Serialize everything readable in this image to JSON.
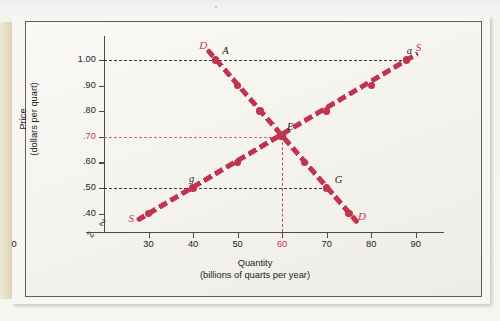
{
  "figure": {
    "background_color": "#f4f3ee",
    "frame_color": "#5d6066"
  },
  "chart_data": {
    "type": "line",
    "title": "",
    "xlabel": "Quantity",
    "xlabel_sub": "(billions of quarts per year)",
    "ylabel": "Price",
    "ylabel_sub": "(dollars per quart)",
    "xlim": [
      20,
      95
    ],
    "ylim": [
      0.33,
      1.07
    ],
    "grid": false,
    "legend": "none",
    "axis_break_x": true,
    "axis_break_y": true,
    "origin_label": "0",
    "xticks": [
      "30",
      "40",
      "50",
      "60",
      "70",
      "80",
      "90"
    ],
    "xtick_values": [
      30,
      40,
      50,
      60,
      70,
      80,
      90
    ],
    "xtick_highlight": "60",
    "yticks": [
      "1.00",
      ".90",
      ".80",
      ".70",
      ".60",
      ".50",
      ".40"
    ],
    "ytick_values": [
      1.0,
      0.9,
      0.8,
      0.7,
      0.6,
      0.5,
      0.4
    ],
    "ytick_highlight": ".70",
    "series": [
      {
        "name": "D",
        "label": "Demand",
        "color": "#c1334f",
        "style": "dashed-thick",
        "start_label": "D",
        "end_label": "D",
        "points": [
          {
            "x": 45,
            "y": 1.0
          },
          {
            "x": 50,
            "y": 0.9
          },
          {
            "x": 55,
            "y": 0.8
          },
          {
            "x": 60,
            "y": 0.7
          },
          {
            "x": 65,
            "y": 0.6
          },
          {
            "x": 70,
            "y": 0.5
          },
          {
            "x": 75,
            "y": 0.4
          }
        ]
      },
      {
        "name": "S",
        "label": "Supply",
        "color": "#c1334f",
        "style": "dashed-thick",
        "start_label": "S",
        "end_label": "S",
        "points": [
          {
            "x": 30,
            "y": 0.4
          },
          {
            "x": 40,
            "y": 0.5
          },
          {
            "x": 50,
            "y": 0.6
          },
          {
            "x": 60,
            "y": 0.7
          },
          {
            "x": 70,
            "y": 0.8
          },
          {
            "x": 80,
            "y": 0.9
          },
          {
            "x": 88,
            "y": 1.0
          }
        ]
      }
    ],
    "annotations": [
      {
        "text": "A",
        "x": 45,
        "y": 1.0,
        "note": "demand at price 1.00"
      },
      {
        "text": "a",
        "x": 88,
        "y": 1.0,
        "note": "supply at price 1.00"
      },
      {
        "text": "E",
        "x": 60,
        "y": 0.7,
        "note": "equilibrium"
      },
      {
        "text": "g",
        "x": 40,
        "y": 0.5,
        "note": "supply at price .50"
      },
      {
        "text": "G",
        "x": 70,
        "y": 0.5,
        "note": "demand at price .50"
      }
    ],
    "guide_lines": [
      {
        "orientation": "horizontal",
        "value": 1.0,
        "color": "#3c3c40",
        "style": "dashed"
      },
      {
        "orientation": "horizontal",
        "value": 0.5,
        "color": "#3c3c40",
        "style": "dashed"
      },
      {
        "orientation": "horizontal",
        "value": 0.7,
        "color": "#d4667c",
        "style": "dashed"
      },
      {
        "orientation": "vertical",
        "value": 60,
        "color": "#c9455e",
        "style": "dashed"
      }
    ]
  }
}
